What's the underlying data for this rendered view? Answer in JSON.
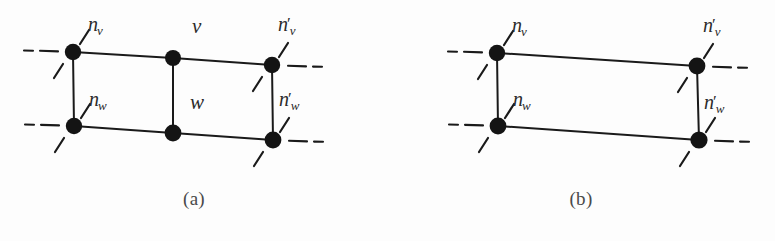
{
  "figure": {
    "background_color": "#fdfdfd",
    "ink_color": "#1a1a1a"
  },
  "panels": [
    {
      "id": "a",
      "caption": "(a)",
      "has_middle_nodes": true,
      "labels": {
        "top_left": {
          "base": "n",
          "sub": "v",
          "prime": ""
        },
        "top_right": {
          "base": "n",
          "sub": "v",
          "prime": "′"
        },
        "bottom_left": {
          "base": "n",
          "sub": "w",
          "prime": ""
        },
        "bottom_right": {
          "base": "n",
          "sub": "w",
          "prime": "′"
        },
        "middle_top": "v",
        "middle_bottom": "w"
      },
      "nodes": [
        {
          "name": "top-left",
          "x": 73,
          "y": 52
        },
        {
          "name": "top-middle",
          "x": 173,
          "y": 58
        },
        {
          "name": "top-right",
          "x": 272,
          "y": 65
        },
        {
          "name": "bottom-left",
          "x": 74,
          "y": 126
        },
        {
          "name": "bottom-middle",
          "x": 173,
          "y": 133
        },
        {
          "name": "bottom-right",
          "x": 273,
          "y": 140
        }
      ]
    },
    {
      "id": "b",
      "caption": "(b)",
      "has_middle_nodes": false,
      "labels": {
        "top_left": {
          "base": "n",
          "sub": "v",
          "prime": ""
        },
        "top_right": {
          "base": "n",
          "sub": "v",
          "prime": "′"
        },
        "bottom_left": {
          "base": "n",
          "sub": "w",
          "prime": ""
        },
        "bottom_right": {
          "base": "n",
          "sub": "w",
          "prime": "′"
        },
        "middle_top": "",
        "middle_bottom": ""
      },
      "nodes": [
        {
          "name": "top-left",
          "x": 110,
          "y": 53
        },
        {
          "name": "top-right",
          "x": 310,
          "y": 66
        },
        {
          "name": "bottom-left",
          "x": 111,
          "y": 126
        },
        {
          "name": "bottom-right",
          "x": 312,
          "y": 140
        }
      ]
    }
  ]
}
